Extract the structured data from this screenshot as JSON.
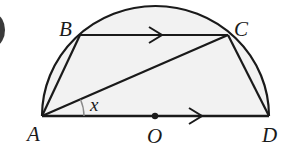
{
  "diagram": {
    "type": "geometry",
    "colors": {
      "stroke": "#1a1a1a",
      "fill": "#f2f2f2",
      "angle_arc": "#8a8a8a",
      "background": "#ffffff"
    },
    "points": {
      "A": {
        "label": "A",
        "x": 42,
        "y": 116
      },
      "B": {
        "label": "B",
        "x": 80,
        "y": 35
      },
      "C": {
        "label": "C",
        "x": 228,
        "y": 35
      },
      "D": {
        "label": "D",
        "x": 269,
        "y": 116
      },
      "O": {
        "label": "O",
        "x": 155,
        "y": 116
      }
    },
    "angle": {
      "label": "x",
      "vertex": "A",
      "between": [
        "AC",
        "AD"
      ]
    },
    "parallel_marks": [
      "BC",
      "AD"
    ],
    "segments": [
      "AB",
      "BC",
      "CD",
      "AD",
      "AC"
    ]
  }
}
